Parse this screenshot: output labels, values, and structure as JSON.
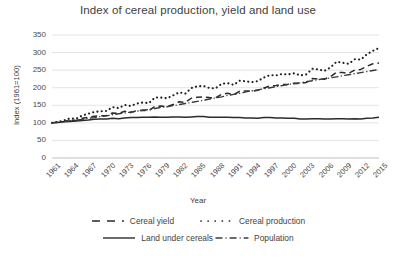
{
  "chart_data": {
    "type": "line",
    "title": "Index of cereal production, yield and land use",
    "xlabel": "Year",
    "ylabel": "Index (1961=100)",
    "ylim": [
      0,
      350
    ],
    "yticks": [
      0,
      50,
      100,
      150,
      200,
      250,
      300,
      350
    ],
    "xlim": [
      1961,
      2015
    ],
    "xticks": [
      1961,
      1964,
      1967,
      1970,
      1973,
      1976,
      1979,
      1982,
      1985,
      1988,
      1991,
      1994,
      1997,
      2000,
      2003,
      2006,
      2009,
      2012,
      2015
    ],
    "grid": "horizontal",
    "legend_position": "bottom",
    "x": [
      1961,
      1962,
      1963,
      1964,
      1965,
      1966,
      1967,
      1968,
      1969,
      1970,
      1971,
      1972,
      1973,
      1974,
      1975,
      1976,
      1977,
      1978,
      1979,
      1980,
      1981,
      1982,
      1983,
      1984,
      1985,
      1986,
      1987,
      1988,
      1989,
      1990,
      1991,
      1992,
      1993,
      1994,
      1995,
      1996,
      1997,
      1998,
      1999,
      2000,
      2001,
      2002,
      2003,
      2004,
      2005,
      2006,
      2007,
      2008,
      2009,
      2010,
      2011,
      2012,
      2013,
      2014,
      2015
    ],
    "series": [
      {
        "name": "Cereal yield",
        "style": "dashed",
        "color": "#2b2b2b",
        "values": [
          100,
          102,
          104,
          108,
          107,
          113,
          116,
          119,
          120,
          121,
          128,
          127,
          133,
          129,
          135,
          136,
          135,
          147,
          148,
          146,
          152,
          160,
          158,
          170,
          173,
          174,
          172,
          171,
          181,
          184,
          180,
          190,
          191,
          190,
          193,
          199,
          205,
          206,
          209,
          210,
          213,
          212,
          215,
          226,
          225,
          224,
          232,
          244,
          243,
          241,
          250,
          252,
          261,
          268,
          270
        ]
      },
      {
        "name": "Cereal production",
        "style": "dotted",
        "color": "#1f1f1f",
        "values": [
          100,
          103,
          107,
          113,
          112,
          121,
          126,
          131,
          133,
          134,
          145,
          142,
          151,
          148,
          155,
          158,
          156,
          172,
          172,
          170,
          178,
          187,
          183,
          199,
          204,
          205,
          199,
          198,
          211,
          213,
          208,
          220,
          218,
          216,
          219,
          229,
          236,
          235,
          239,
          238,
          241,
          235,
          238,
          254,
          252,
          248,
          258,
          274,
          271,
          268,
          281,
          280,
          295,
          305,
          313
        ]
      },
      {
        "name": "Land under cereals",
        "style": "solid",
        "color": "#2b2b2b",
        "values": [
          100,
          101,
          103,
          104,
          105,
          107,
          108,
          110,
          111,
          111,
          113,
          112,
          114,
          115,
          115,
          116,
          116,
          117,
          116,
          116,
          117,
          117,
          116,
          117,
          118,
          118,
          116,
          116,
          116,
          116,
          115,
          115,
          114,
          114,
          113,
          115,
          115,
          114,
          114,
          113,
          113,
          111,
          111,
          112,
          112,
          111,
          111,
          112,
          112,
          111,
          112,
          111,
          113,
          114,
          116
        ]
      },
      {
        "name": "Population",
        "style": "dashdot",
        "color": "#3a3a3a",
        "values": [
          100,
          102,
          104,
          106,
          108,
          110,
          113,
          115,
          118,
          120,
          123,
          126,
          128,
          131,
          133,
          136,
          138,
          141,
          144,
          146,
          149,
          152,
          155,
          158,
          161,
          164,
          168,
          171,
          174,
          178,
          181,
          184,
          188,
          191,
          194,
          197,
          200,
          203,
          206,
          209,
          212,
          214,
          217,
          220,
          223,
          226,
          228,
          231,
          234,
          237,
          240,
          243,
          246,
          249,
          252
        ]
      }
    ]
  },
  "legend": {
    "items": [
      {
        "label": "Cereal yield"
      },
      {
        "label": "Cereal production"
      },
      {
        "label": "Land under cereals"
      },
      {
        "label": "Population"
      }
    ]
  }
}
